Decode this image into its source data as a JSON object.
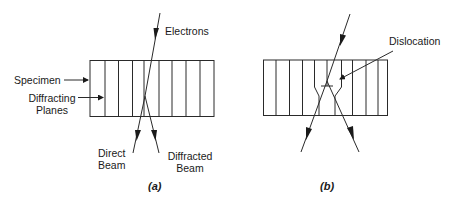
{
  "panel_a": {
    "caption": "(a)",
    "labels": {
      "electrons": "Electrons",
      "specimen": "Specimen",
      "diffracting_planes_1": "Diffracting",
      "diffracting_planes_2": "Planes",
      "direct_beam_1": "Direct",
      "direct_beam_2": "Beam",
      "diffracted_beam_1": "Diffracted",
      "diffracted_beam_2": "Beam"
    }
  },
  "panel_b": {
    "caption": "(b)",
    "labels": {
      "dislocation": "Dislocation"
    }
  },
  "colors": {
    "line": "#2a2a2a",
    "background": "#ffffff"
  }
}
